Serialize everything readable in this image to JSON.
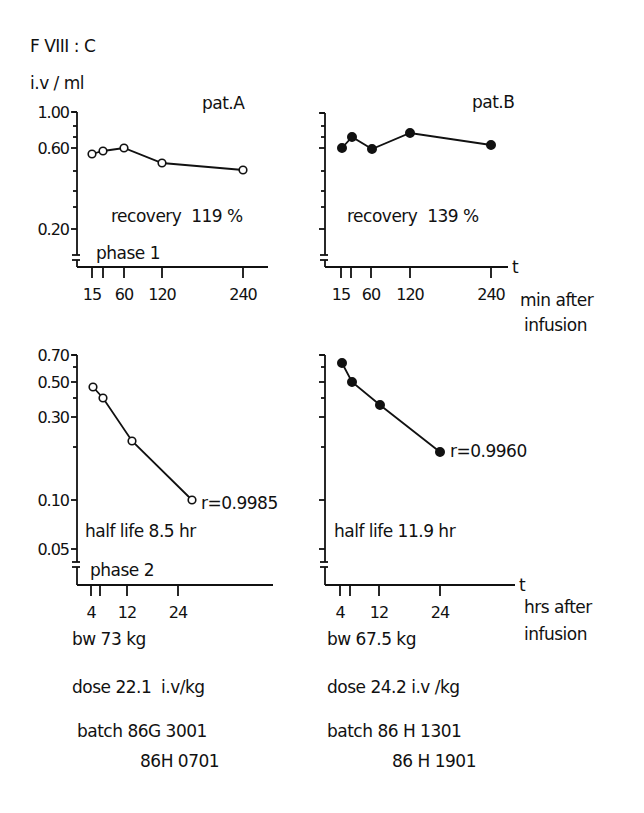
{
  "figure": {
    "y_quantity": "F VIII : C",
    "y_unit": "i.v / ml",
    "time_marker": "t",
    "upper_x_unit_line1": "min after",
    "upper_x_unit_line2": "infusion",
    "lower_x_unit_line1": "hrs after",
    "lower_x_unit_line2": "infusion",
    "phase1_label": "phase 1",
    "phase2_label": "phase 2"
  },
  "patients": [
    {
      "name": "pat.A",
      "marker": "open-circle",
      "recovery": "recovery  119 %",
      "half_life": "half life 8.5 hr",
      "r_value": "r=0.9985",
      "bw": "bw 73 kg",
      "dose": "dose 22.1  i.v/kg",
      "batch_line1": "batch 86G 3001",
      "batch_line2": "86H 0701"
    },
    {
      "name": "pat.B",
      "marker": "filled-circle",
      "recovery": "recovery  139 %",
      "half_life": "half life 11.9 hr",
      "r_value": "r=0.9960",
      "bw": "bw 67.5 kg",
      "dose": "dose 24.2 i.v /kg",
      "batch_line1": "batch 86 H 1301",
      "batch_line2": "86 H 1901"
    }
  ],
  "chart_data": [
    {
      "type": "line",
      "title": "pat.A — phase 1",
      "xlabel": "min after infusion",
      "ylabel": "F VIII:C i.v/ml",
      "y_scale": "log",
      "x_ticks": [
        15,
        30,
        60,
        120,
        240
      ],
      "x_tick_labels": [
        "15",
        "",
        "60",
        "120",
        "240"
      ],
      "y_ticks": [
        0.2,
        0.6,
        1.0
      ],
      "x": [
        15,
        30,
        60,
        120,
        240
      ],
      "values": [
        0.56,
        0.58,
        0.6,
        0.5,
        0.46
      ],
      "annotation": "recovery 119 %"
    },
    {
      "type": "line",
      "title": "pat.B — phase 1",
      "xlabel": "min after infusion",
      "ylabel": "F VIII:C i.v/ml",
      "y_scale": "log",
      "x_ticks": [
        15,
        30,
        60,
        120,
        240
      ],
      "x_tick_labels": [
        "15",
        "",
        "60",
        "120",
        "240"
      ],
      "y_ticks": [
        0.2,
        0.6,
        1.0
      ],
      "x": [
        15,
        30,
        60,
        120,
        240
      ],
      "values": [
        0.6,
        0.68,
        0.6,
        0.72,
        0.62
      ],
      "annotation": "recovery 139 %"
    },
    {
      "type": "line",
      "title": "pat.A — phase 2",
      "xlabel": "hrs after infusion",
      "ylabel": "F VIII:C i.v/ml",
      "y_scale": "log",
      "x_ticks": [
        4,
        6,
        12,
        24
      ],
      "x_tick_labels": [
        "4",
        "",
        "12",
        "24"
      ],
      "y_ticks": [
        0.05,
        0.1,
        0.3,
        0.5,
        0.7
      ],
      "x": [
        4,
        6,
        12,
        24
      ],
      "values": [
        0.47,
        0.4,
        0.22,
        0.1
      ],
      "annotation": "half life 8.5 hr; r=0.9985"
    },
    {
      "type": "line",
      "title": "pat.B — phase 2",
      "xlabel": "hrs after infusion",
      "ylabel": "F VIII:C i.v/ml",
      "y_scale": "log",
      "x_ticks": [
        4,
        6,
        12,
        24
      ],
      "x_tick_labels": [
        "4",
        "",
        "12",
        "24"
      ],
      "y_ticks": [
        0.05,
        0.1,
        0.3,
        0.5,
        0.7
      ],
      "x": [
        4,
        6,
        12,
        24
      ],
      "values": [
        0.63,
        0.5,
        0.36,
        0.19
      ],
      "annotation": "half life 11.9 hr; r=0.9960"
    }
  ],
  "layout": {
    "panels": [
      {
        "axis_x": 77,
        "axis_bottom": 267,
        "axis_top": 112,
        "x_end": 268,
        "px": [
          92,
          103,
          124,
          162,
          243
        ],
        "tick_px": [
          92,
          103,
          124,
          162,
          243
        ],
        "py": [
          154,
          151,
          148,
          163,
          170
        ],
        "ytick_y": [
          229,
          148,
          112
        ],
        "ytick_labels": [
          "0.20",
          "0.60",
          "1.00"
        ],
        "minor_y": [
          126,
          137,
          171,
          191,
          207
        ],
        "break_y": 258
      },
      {
        "axis_x": 325,
        "axis_bottom": 267,
        "axis_top": 113,
        "x_end": 508,
        "px": [
          342,
          352,
          372,
          410,
          491
        ],
        "tick_px": [
          341,
          351,
          371,
          410,
          491
        ],
        "py": [
          148,
          137,
          149,
          133,
          145
        ],
        "ytick_y": [
          229,
          148,
          113
        ],
        "ytick_labels": [
          "",
          "",
          ""
        ],
        "minor_y": [
          126,
          137,
          171,
          191,
          207
        ],
        "break_y": 258
      },
      {
        "axis_x": 77,
        "axis_bottom": 585,
        "axis_top": 355,
        "x_end": 273,
        "px": [
          93,
          103,
          132,
          192
        ],
        "tick_px": [
          91,
          100,
          127,
          178
        ],
        "py": [
          387,
          398,
          441,
          500
        ],
        "ytick_y": [
          549,
          500,
          417,
          382,
          355
        ],
        "ytick_labels": [
          "0.05",
          "0.10",
          "0.30",
          "0.50",
          "0.70"
        ],
        "minor_y": [
          367,
          398,
          447
        ],
        "break_y": 565
      },
      {
        "axis_x": 325,
        "axis_bottom": 585,
        "axis_top": 355,
        "x_end": 515,
        "px": [
          342,
          352,
          380,
          440
        ],
        "tick_px": [
          340,
          350,
          379,
          440
        ],
        "py": [
          363,
          382,
          405,
          452
        ],
        "ytick_y": [
          549,
          500,
          417,
          382,
          355
        ],
        "ytick_labels": [
          "",
          "",
          "",
          "",
          ""
        ],
        "minor_y": [
          367,
          398,
          447
        ],
        "break_y": 565
      }
    ]
  }
}
